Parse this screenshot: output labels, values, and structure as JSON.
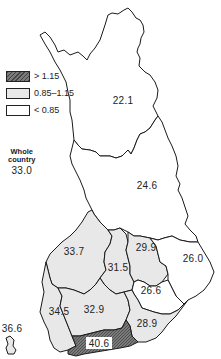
{
  "legend": {
    "items": [
      {
        "label": "> 1.15",
        "fill": "#6e6e6e",
        "pattern": "hatched"
      },
      {
        "label": "0.85–1.15",
        "fill": "#e8e8e8",
        "pattern": "solid"
      },
      {
        "label": "< 0.85",
        "fill": "#ffffff",
        "pattern": "solid"
      }
    ]
  },
  "whole_country": {
    "title_line1": "Whole",
    "title_line2": "country",
    "value": "33.0"
  },
  "regions": [
    {
      "id": "lapland",
      "value": "22.1",
      "category": "< 0.85"
    },
    {
      "id": "oulu",
      "value": "24.6",
      "category": "< 0.85"
    },
    {
      "id": "vaasa",
      "value": "33.7",
      "category": "0.85–1.15"
    },
    {
      "id": "central-finland",
      "value": "31.5",
      "category": "0.85–1.15"
    },
    {
      "id": "kuopio",
      "value": "29.9",
      "category": "0.85–1.15"
    },
    {
      "id": "north-karelia",
      "value": "26.0",
      "category": "< 0.85"
    },
    {
      "id": "mikkeli",
      "value": "26.6",
      "category": "< 0.85"
    },
    {
      "id": "turku-pori",
      "value": "34.5",
      "category": "0.85–1.15"
    },
    {
      "id": "hame",
      "value": "32.9",
      "category": "0.85–1.15"
    },
    {
      "id": "kymi",
      "value": "28.9",
      "category": "0.85–1.15"
    },
    {
      "id": "uusimaa",
      "value": "40.6",
      "category": "> 1.15"
    },
    {
      "id": "aland",
      "value": "36.6",
      "category": "0.85–1.15"
    }
  ]
}
